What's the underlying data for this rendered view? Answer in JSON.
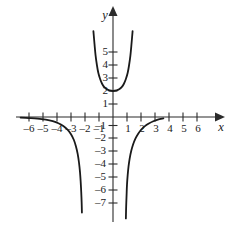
{
  "chart_data": {
    "type": "line",
    "title": "",
    "xlabel": "x",
    "ylabel": "y",
    "xlim": [
      -6.8,
      6.8
    ],
    "ylim": [
      -7.8,
      6.6
    ],
    "grid": false,
    "legend": null,
    "x_ticks": [
      -6,
      -5,
      -4,
      -3,
      -2,
      -1,
      1,
      2,
      3,
      4,
      5,
      6
    ],
    "y_ticks": [
      -7,
      -6,
      -5,
      -4,
      -3,
      -2,
      -1,
      1,
      2,
      3,
      4,
      5
    ],
    "x_tick_labels": [
      "–6",
      "–5",
      "–4",
      "–3",
      "–2",
      "–1",
      "1",
      "2",
      "3",
      "4",
      "5",
      "6"
    ],
    "y_tick_labels": [
      "–7",
      "–6",
      "–5",
      "–4",
      "–3",
      "–2",
      "–1",
      "1",
      "2",
      "3",
      "4",
      "5"
    ],
    "curve_color": "#1a1a1a",
    "axis_color": "#2b2b2b",
    "series": [
      {
        "name": "upper-branch",
        "description": "U-shaped branch with minimum at (0, 2), arms rising steeply past y = 6",
        "points": [
          [
            -1.4,
            6.6
          ],
          [
            -1.32,
            5.6
          ],
          [
            -1.24,
            4.7
          ],
          [
            -1.15,
            4.0
          ],
          [
            -1.05,
            3.4
          ],
          [
            -0.92,
            2.92
          ],
          [
            -0.78,
            2.56
          ],
          [
            -0.62,
            2.3
          ],
          [
            -0.44,
            2.13
          ],
          [
            -0.25,
            2.04
          ],
          [
            0.0,
            2.0
          ],
          [
            0.25,
            2.04
          ],
          [
            0.44,
            2.13
          ],
          [
            0.62,
            2.3
          ],
          [
            0.78,
            2.56
          ],
          [
            0.92,
            2.92
          ],
          [
            1.05,
            3.4
          ],
          [
            1.15,
            4.0
          ],
          [
            1.24,
            4.7
          ],
          [
            1.32,
            5.6
          ],
          [
            1.4,
            6.6
          ]
        ]
      },
      {
        "name": "left-branch",
        "description": "Falls from horizontal asymptote y = 0 near x = -6.6 down toward vertical asymptote x = -2.2",
        "points": [
          [
            -6.6,
            -0.05
          ],
          [
            -6.0,
            -0.08
          ],
          [
            -5.4,
            -0.12
          ],
          [
            -4.8,
            -0.2
          ],
          [
            -4.3,
            -0.32
          ],
          [
            -3.9,
            -0.48
          ],
          [
            -3.55,
            -0.7
          ],
          [
            -3.25,
            -0.98
          ],
          [
            -3.0,
            -1.32
          ],
          [
            -2.8,
            -1.75
          ],
          [
            -2.65,
            -2.25
          ],
          [
            -2.52,
            -2.85
          ],
          [
            -2.43,
            -3.5
          ],
          [
            -2.36,
            -4.2
          ],
          [
            -2.31,
            -4.95
          ],
          [
            -2.27,
            -5.75
          ],
          [
            -2.24,
            -6.55
          ],
          [
            -2.22,
            -7.35
          ]
        ]
      },
      {
        "name": "right-branch",
        "description": "Rises from vertical asymptote x = 0.9 toward horizontal asymptote y = 0, flattening by x = 3.6",
        "points": [
          [
            0.92,
            -7.8
          ],
          [
            0.94,
            -6.9
          ],
          [
            0.97,
            -6.0
          ],
          [
            1.0,
            -5.2
          ],
          [
            1.05,
            -4.45
          ],
          [
            1.11,
            -3.8
          ],
          [
            1.19,
            -3.2
          ],
          [
            1.3,
            -2.62
          ],
          [
            1.44,
            -2.1
          ],
          [
            1.6,
            -1.66
          ],
          [
            1.8,
            -1.28
          ],
          [
            2.02,
            -0.96
          ],
          [
            2.28,
            -0.7
          ],
          [
            2.56,
            -0.5
          ],
          [
            2.88,
            -0.33
          ],
          [
            3.2,
            -0.2
          ],
          [
            3.6,
            -0.1
          ]
        ]
      }
    ],
    "asymptotes": {
      "vertical": [
        -2.2,
        0.9
      ],
      "horizontal": [
        0
      ]
    }
  }
}
